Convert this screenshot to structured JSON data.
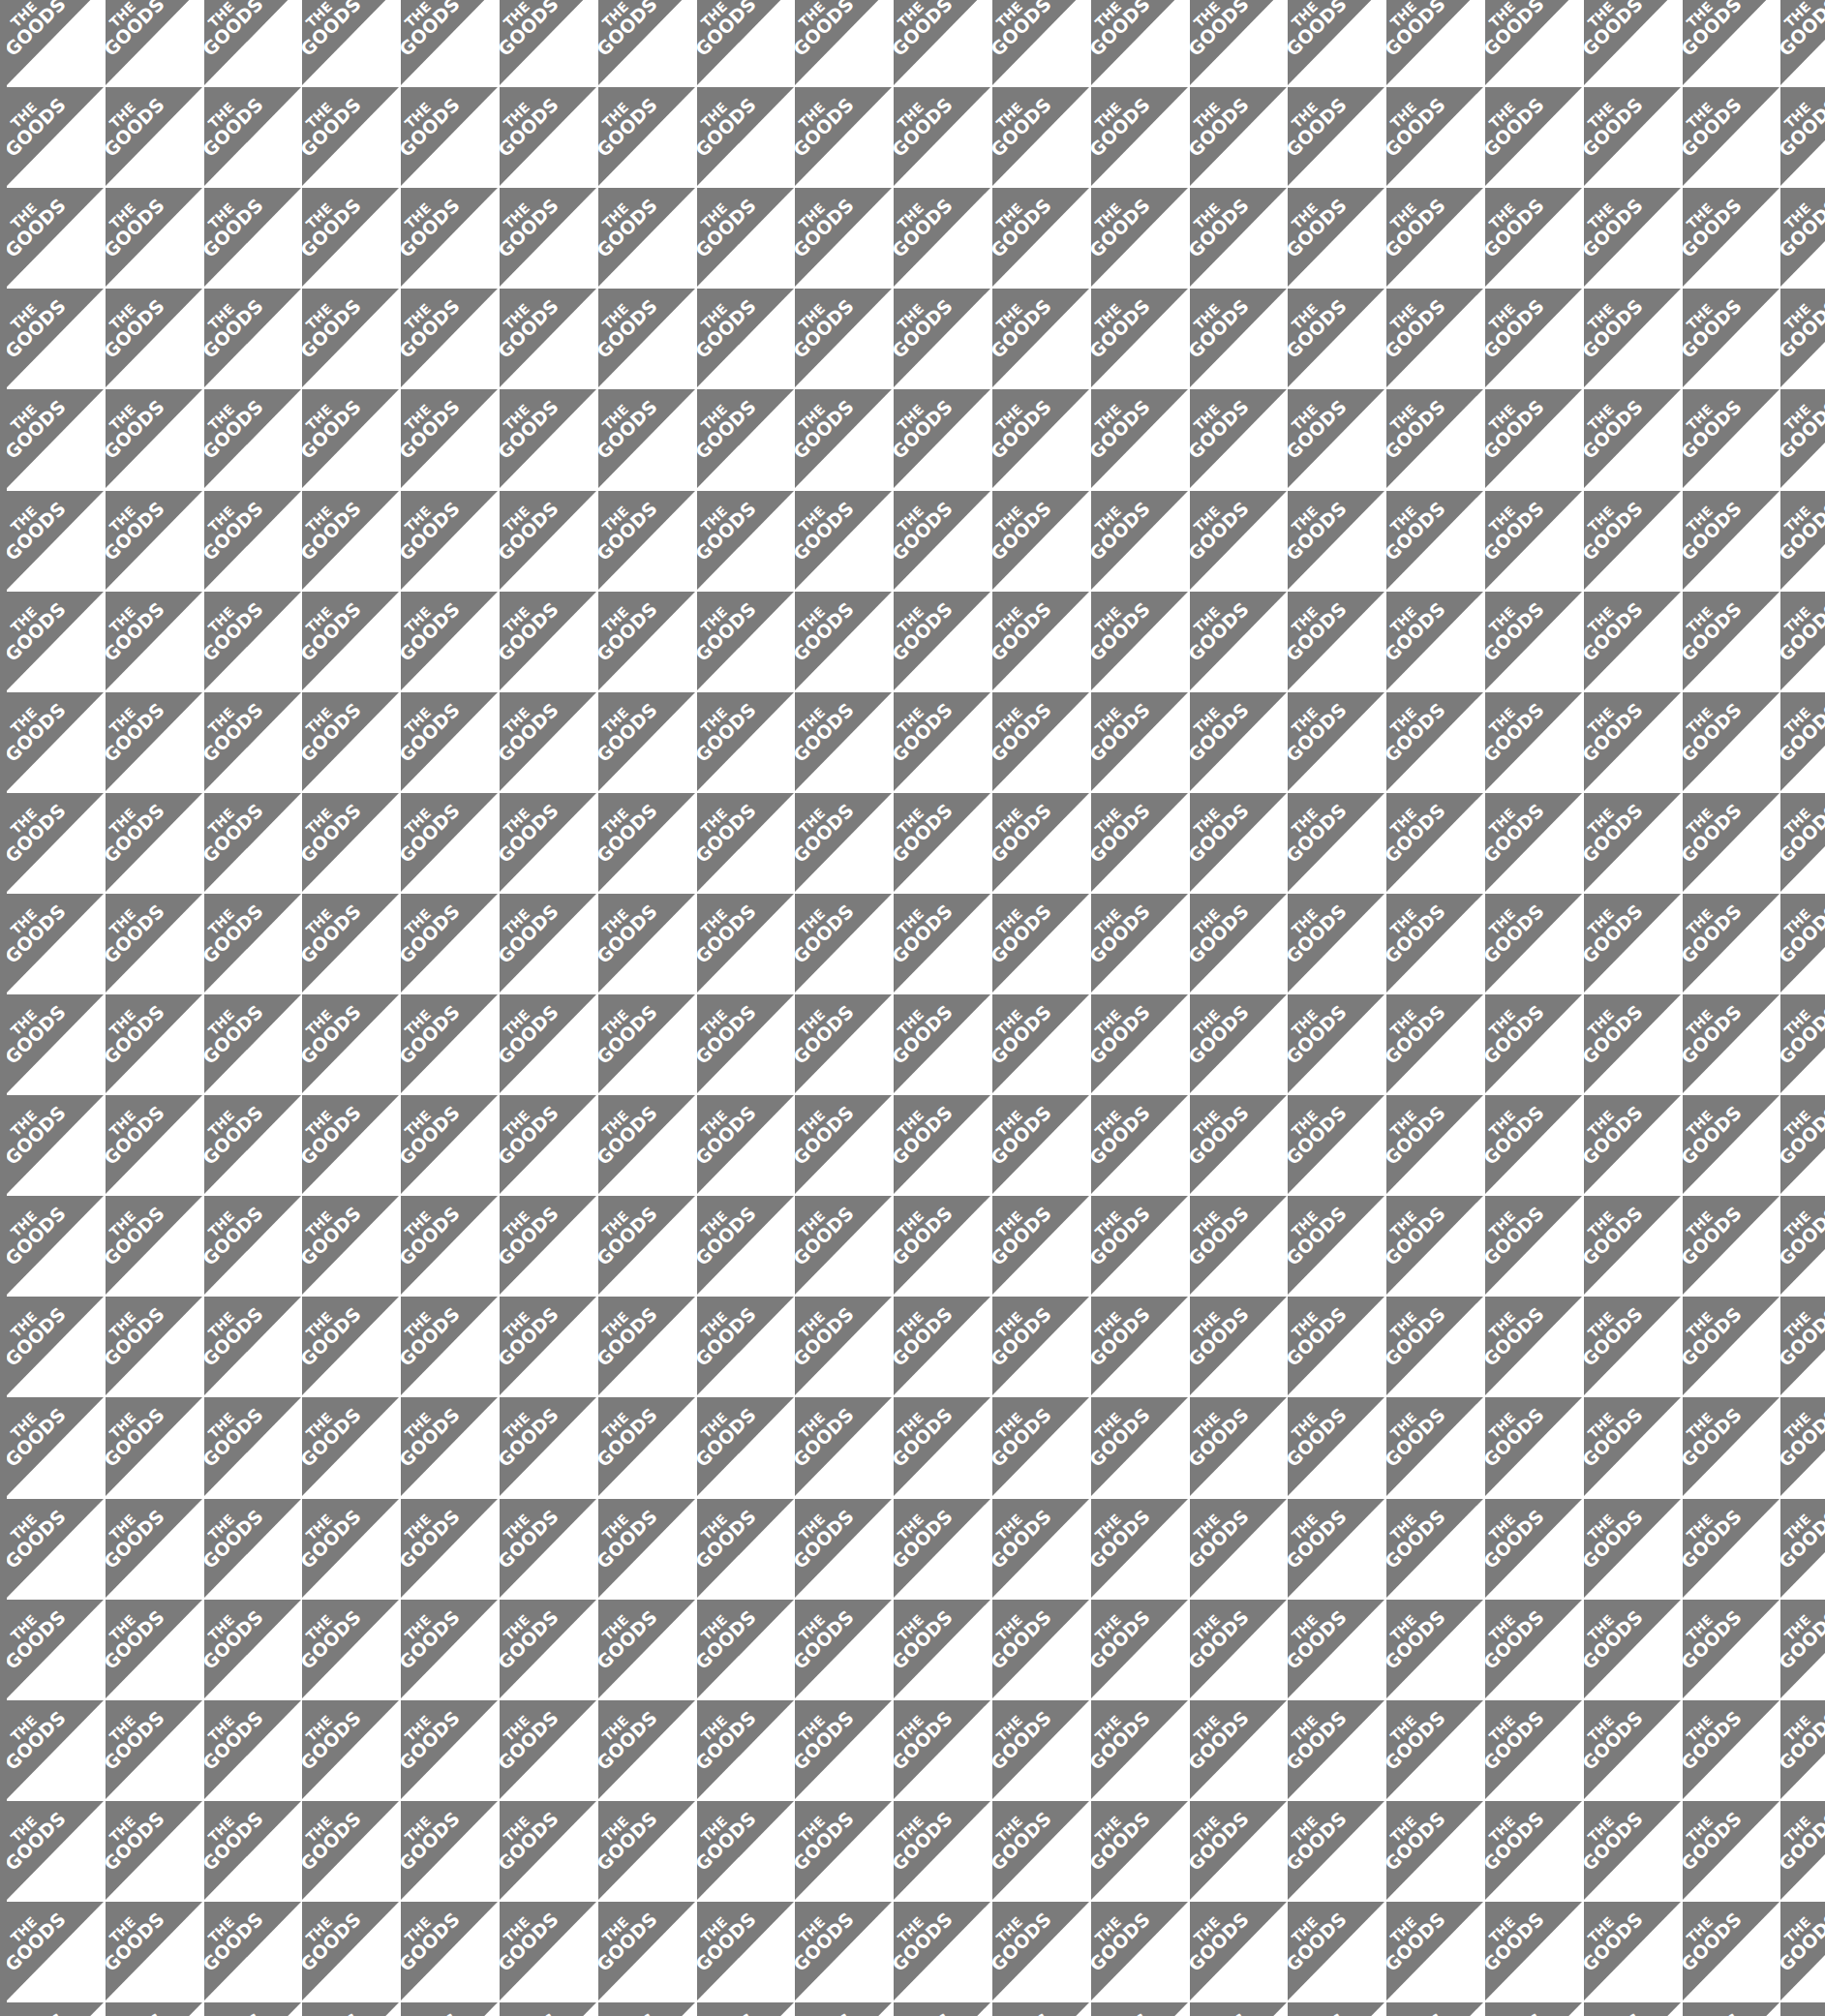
{
  "pattern": {
    "brand_line1": "THE",
    "brand_line2": "GOODS",
    "colors": {
      "triangle": "#7b7b7b",
      "background": "#ffffff",
      "text": "#ffffff"
    },
    "cell_width": 101.8,
    "cell_height": 104.1,
    "columns": 19,
    "rows": 21,
    "origin_x": 7,
    "origin_y": -14
  }
}
